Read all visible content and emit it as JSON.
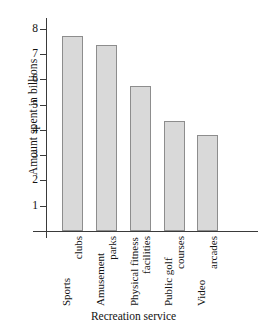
{
  "chart_data": {
    "type": "bar",
    "title": "",
    "xlabel": "Recreation service",
    "ylabel": "Amount spent in billions",
    "categories": [
      "Sports clubs",
      "Amusement parks",
      "Physical fitness facilities",
      "Public golf courses",
      "Video arcades"
    ],
    "category_lines": [
      [
        "Sports",
        "clubs"
      ],
      [
        "Amusement",
        "parks"
      ],
      [
        "Physical fitness",
        "facilities"
      ],
      [
        "Public golf",
        "courses"
      ],
      [
        "Video",
        "arcades"
      ]
    ],
    "values": [
      7.7,
      7.35,
      5.75,
      4.35,
      3.8
    ],
    "ylim": [
      0,
      8.4
    ],
    "yticks": [
      1,
      2,
      3,
      4,
      5,
      6,
      7,
      8
    ],
    "ytick_labels": [
      "1",
      "2",
      "3",
      "4",
      "5",
      "6",
      "7",
      "8"
    ],
    "grid": false,
    "legend": false,
    "bar_fill_color": "#d9d9d9",
    "bar_edge_color": "#8d8d8d",
    "axis_color": "#3a3a3a",
    "background_color": "#ffffff"
  }
}
